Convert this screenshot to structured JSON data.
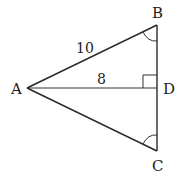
{
  "diagram": {
    "type": "triangle",
    "vertices": {
      "A": {
        "label": "A",
        "x": 27,
        "y": 88
      },
      "B": {
        "label": "B",
        "x": 157,
        "y": 25
      },
      "C": {
        "label": "C",
        "x": 157,
        "y": 151
      },
      "D": {
        "label": "D",
        "x": 157,
        "y": 88
      }
    },
    "segments": [
      {
        "from": "A",
        "to": "B",
        "length_label": "10"
      },
      {
        "from": "A",
        "to": "C",
        "length_label": ""
      },
      {
        "from": "B",
        "to": "C",
        "length_label": ""
      },
      {
        "from": "A",
        "to": "D",
        "length_label": "8"
      }
    ],
    "marks": {
      "right_angle_at": "D",
      "equal_angles": [
        "B",
        "C"
      ]
    },
    "labels": {
      "A": "A",
      "B": "B",
      "C": "C",
      "D": "D",
      "AB": "10",
      "AD": "8"
    },
    "colors": {
      "stroke": "#2a2a2a",
      "text": "#222222",
      "background": "#ffffff"
    }
  }
}
